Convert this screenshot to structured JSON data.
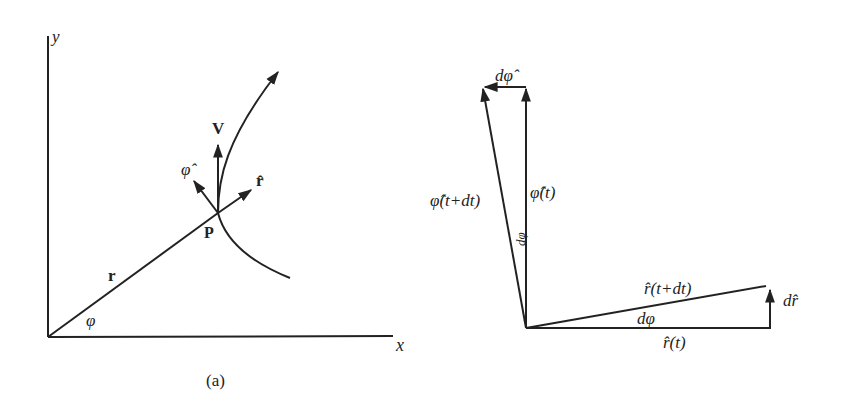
{
  "figure_a": {
    "caption": "(a)",
    "axis_x_label": "x",
    "axis_y_label": "y",
    "position_vector_label": "r",
    "angle_label": "φ",
    "point_label": "P",
    "velocity_label": "V",
    "unit_r_label": "r̂",
    "unit_phi_label": "φ̂"
  },
  "figure_b": {
    "phi_t_label": "φ̂(t)",
    "phi_t_dt_label": "φ̂(t+dt)",
    "d_phi_hat_label": "dφ̂",
    "r_t_label": "r̂(t)",
    "r_t_dt_label": "r̂(t+dt)",
    "d_r_hat_label": "dr̂",
    "d_phi_angle_label": "dφ",
    "d_phi_angle_label_top": "dφ"
  },
  "colors": {
    "ink": "#222222",
    "background": "#ffffff"
  }
}
